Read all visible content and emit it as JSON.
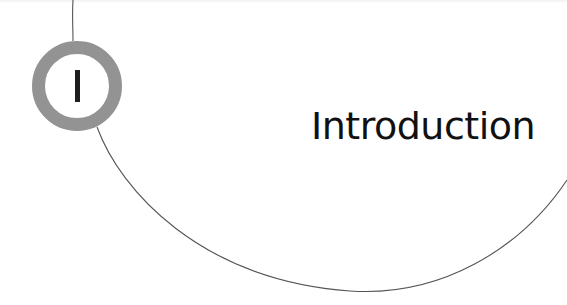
{
  "chapter": {
    "number": "I",
    "title": "Introduction"
  },
  "colors": {
    "ring": "#939393",
    "numeral": "#1e1e1e",
    "arc": "#555555",
    "title": "#111111",
    "background": "#ffffff"
  }
}
